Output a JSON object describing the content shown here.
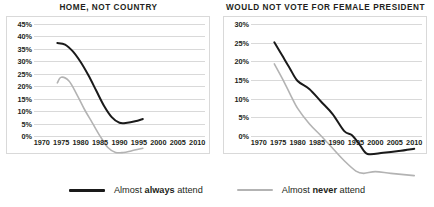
{
  "colors": {
    "always_attend": "#1a1a1a",
    "never_attend": "#b3b3b3",
    "grid": "#d9d9d9",
    "border": "#d9d9d9",
    "text": "#231f20"
  },
  "legend": {
    "items": [
      {
        "prefix": "Almost ",
        "bold": "always",
        "suffix": " attend",
        "color": "#1a1a1a",
        "name": "almost-always-attend"
      },
      {
        "prefix": "Almost ",
        "bold": "never",
        "suffix": " attend",
        "color": "#b3b3b3",
        "name": "almost-never-attend"
      }
    ]
  },
  "chart_data": [
    {
      "type": "line",
      "title": "HOME, NOT COUNTRY",
      "xlabel": "",
      "ylabel": "",
      "xlim": [
        1968,
        2012
      ],
      "ylim": [
        0,
        45
      ],
      "grid": true,
      "legend_position": "bottom",
      "xticks": [
        1970,
        1975,
        1980,
        1985,
        1990,
        1995,
        2000,
        2005,
        2010
      ],
      "xticklabels": [
        "1970",
        "1975",
        "1980",
        "1985",
        "1990",
        "1995",
        "2000",
        "2005",
        "2010"
      ],
      "yticks": [
        0,
        5,
        10,
        15,
        20,
        25,
        30,
        35,
        40,
        45
      ],
      "yticklabels": [
        "0%",
        "5%",
        "10%",
        "15%",
        "20%",
        "25%",
        "30%",
        "35%",
        "40%",
        "45%"
      ],
      "series": [
        {
          "name": "Almost always attend",
          "color": "#1a1a1a",
          "x": [
            1974,
            1976,
            1978,
            1980,
            1982,
            1984,
            1986,
            1988,
            1990,
            1992,
            1994,
            1996
          ],
          "values": [
            40.0,
            39.6,
            37.8,
            35.0,
            31.5,
            27.5,
            23.5,
            20.5,
            19.0,
            19.0,
            19.4,
            20.0
          ]
        },
        {
          "name": "Almost never attend",
          "color": "#b3b3b3",
          "x": [
            1974,
            1975,
            1977,
            1979,
            1981,
            1983,
            1985,
            1987,
            1989,
            1991,
            1993,
            1996
          ],
          "values": [
            29.5,
            31.0,
            30.0,
            26.5,
            22.5,
            19.0,
            15.5,
            12.5,
            11.2,
            11.2,
            11.6,
            12.3
          ]
        }
      ]
    },
    {
      "type": "line",
      "title": "WOULD NOT VOTE FOR FEMALE PRESIDENT",
      "xlabel": "",
      "ylabel": "",
      "xlim": [
        1968,
        2012
      ],
      "ylim": [
        0,
        30
      ],
      "grid": true,
      "legend_position": "bottom",
      "xticks": [
        1970,
        1975,
        1980,
        1985,
        1990,
        1995,
        2000,
        2005,
        2010
      ],
      "xticklabels": [
        "1970",
        "1975",
        "1980",
        "1985",
        "1990",
        "1995",
        "2000",
        "2005",
        "2010"
      ],
      "yticks": [
        0,
        5,
        10,
        15,
        20,
        25,
        30
      ],
      "yticklabels": [
        "0%",
        "5%",
        "10%",
        "15%",
        "20%",
        "25%",
        "30%"
      ],
      "series": [
        {
          "name": "Almost always attend",
          "color": "#1a1a1a",
          "x": [
            1974,
            1976,
            1978,
            1980,
            1983,
            1986,
            1989,
            1992,
            1994,
            1996,
            1998,
            2002,
            2006,
            2010
          ],
          "values": [
            26.8,
            24.5,
            22.2,
            20.0,
            18.6,
            16.4,
            14.2,
            11.2,
            10.5,
            8.8,
            7.2,
            7.4,
            7.7,
            8.1
          ]
        },
        {
          "name": "Almost never attend",
          "color": "#b3b3b3",
          "x": [
            1974,
            1976,
            1978,
            1980,
            1983,
            1986,
            1989,
            1992,
            1995,
            1997,
            2000,
            2004,
            2010
          ],
          "values": [
            23.0,
            20.5,
            17.8,
            15.2,
            12.5,
            10.4,
            8.2,
            6.0,
            4.2,
            3.8,
            4.1,
            3.8,
            3.4
          ]
        }
      ]
    }
  ]
}
